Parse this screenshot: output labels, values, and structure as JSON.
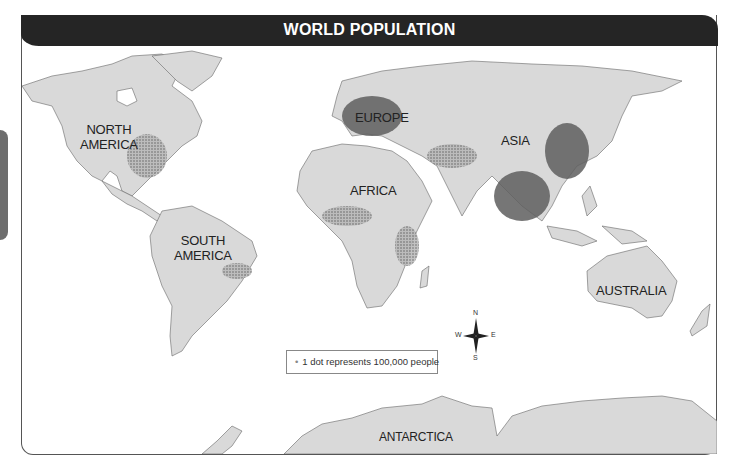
{
  "title": "WORLD POPULATION",
  "side_tab": {
    "label": ""
  },
  "continents": [
    {
      "name": "NORTH AMERICA",
      "line1": "NORTH",
      "line2": "AMERICA"
    },
    {
      "name": "SOUTH AMERICA",
      "line1": "SOUTH",
      "line2": "AMERICA"
    },
    {
      "name": "EUROPE"
    },
    {
      "name": "AFRICA"
    },
    {
      "name": "ASIA"
    },
    {
      "name": "AUSTRALIA"
    },
    {
      "name": "ANTARCTICA"
    }
  ],
  "legend": {
    "marker": "•",
    "text": "1 dot represents 100,000 people"
  },
  "compass": {
    "n": "N",
    "s": "S",
    "e": "E",
    "w": "W"
  },
  "colors": {
    "land": "#d9d9d9",
    "dense": "#555555",
    "header": "#252525",
    "border": "#555555"
  }
}
